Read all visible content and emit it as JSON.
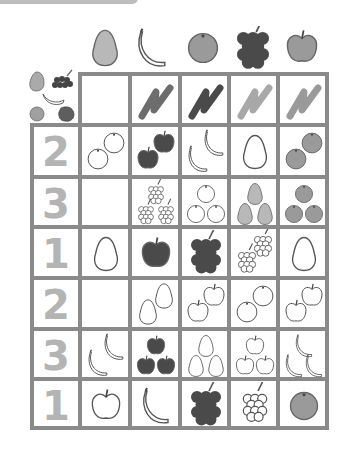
{
  "worksheet": {
    "header_fruits": [
      "pear",
      "banana",
      "orange",
      "grapes",
      "apple"
    ],
    "color_scribbles": [
      {
        "column": "banana",
        "shade": "#6d6d6d"
      },
      {
        "column": "orange",
        "shade": "#4a4a4a"
      },
      {
        "column": "grapes",
        "shade": "#a8a8a8"
      },
      {
        "column": "apple",
        "shade": "#9a9a9a"
      }
    ],
    "rows": [
      {
        "number": "2",
        "cells": [
          {
            "fruit": "orange",
            "count": 2,
            "style": "outline"
          },
          {
            "fruit": "apple",
            "count": 2,
            "style": "dark"
          },
          {
            "fruit": "banana",
            "count": 2,
            "style": "outline"
          },
          {
            "fruit": "pear",
            "count": 1,
            "style": "outline"
          },
          {
            "fruit": "orange",
            "count": 2,
            "style": "gray"
          }
        ]
      },
      {
        "number": "3",
        "cells": [
          {
            "fruit": null,
            "count": 0,
            "style": "empty"
          },
          {
            "fruit": "grapes",
            "count": 3,
            "style": "outline"
          },
          {
            "fruit": "orange",
            "count": 3,
            "style": "outline"
          },
          {
            "fruit": "pear",
            "count": 3,
            "style": "light"
          },
          {
            "fruit": "orange",
            "count": 3,
            "style": "gray"
          }
        ]
      },
      {
        "number": "1",
        "cells": [
          {
            "fruit": "pear",
            "count": 1,
            "style": "outline"
          },
          {
            "fruit": "apple",
            "count": 1,
            "style": "dark"
          },
          {
            "fruit": "grapes",
            "count": 1,
            "style": "dark"
          },
          {
            "fruit": "grapes",
            "count": 2,
            "style": "outline"
          },
          {
            "fruit": "pear",
            "count": 1,
            "style": "outline"
          }
        ]
      },
      {
        "number": "2",
        "cells": [
          {
            "fruit": null,
            "count": 0,
            "style": "empty"
          },
          {
            "fruit": "pear",
            "count": 2,
            "style": "outline"
          },
          {
            "fruit": "apple",
            "count": 2,
            "style": "outline"
          },
          {
            "fruit": "orange",
            "count": 2,
            "style": "outline"
          },
          {
            "fruit": "apple",
            "count": 2,
            "style": "outline"
          }
        ]
      },
      {
        "number": "3",
        "cells": [
          {
            "fruit": "banana",
            "count": 2,
            "style": "outline"
          },
          {
            "fruit": "apple",
            "count": 3,
            "style": "dark"
          },
          {
            "fruit": "pear",
            "count": 3,
            "style": "outline"
          },
          {
            "fruit": "apple",
            "count": 3,
            "style": "outline"
          },
          {
            "fruit": "banana",
            "count": 3,
            "style": "outline"
          }
        ]
      },
      {
        "number": "1",
        "cells": [
          {
            "fruit": "apple",
            "count": 1,
            "style": "outline"
          },
          {
            "fruit": "banana",
            "count": 1,
            "style": "outline"
          },
          {
            "fruit": "grapes",
            "count": 1,
            "style": "dark"
          },
          {
            "fruit": "grapes",
            "count": 1,
            "style": "outline"
          },
          {
            "fruit": "orange",
            "count": 1,
            "style": "gray"
          }
        ]
      }
    ],
    "colors": {
      "grid_line": "#8a8a8a",
      "number": "#b4b4b4",
      "dark": "#4a4a4a",
      "gray": "#9a9a9a",
      "light": "#b8b8b8",
      "tab": "#bdbdbd"
    }
  }
}
